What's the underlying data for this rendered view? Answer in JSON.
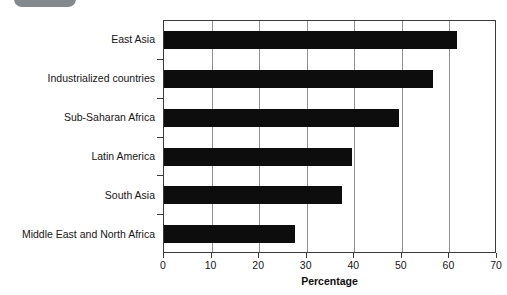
{
  "caption": {
    "badge_label": "",
    "text": "",
    "badge_color": "#6f7479"
  },
  "chart_data": {
    "type": "bar",
    "orientation": "horizontal",
    "title": "",
    "xlabel": "Percentage",
    "ylabel": "",
    "xlim": [
      0,
      70
    ],
    "xticks": [
      0,
      10,
      20,
      30,
      40,
      50,
      60,
      70
    ],
    "xtick_labels": [
      "0",
      "10",
      "20",
      "30",
      "40",
      "50",
      "60",
      "70"
    ],
    "grid": true,
    "grid_axis": "x",
    "legend": false,
    "bar_color": "#0d0d0d",
    "categories": [
      "East Asia",
      "Industrialized countries",
      "Sub-Saharan Africa",
      "Latin America",
      "South Asia",
      "Middle East and North Africa"
    ],
    "values": [
      61.5,
      56.5,
      49.5,
      39.5,
      37.5,
      27.5
    ]
  }
}
